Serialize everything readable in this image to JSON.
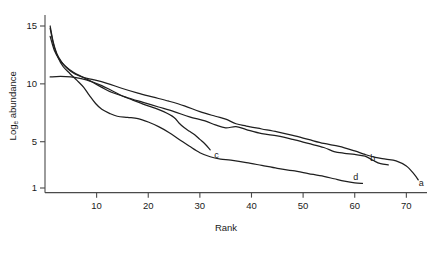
{
  "chart_data": {
    "type": "line",
    "title": "",
    "xlabel": "Rank",
    "ylabel": "Log_e abundance",
    "ylabel_base": "Log",
    "ylabel_sub": "e",
    "ylabel_rest": " abundance",
    "xlim": [
      0,
      74
    ],
    "ylim": [
      0.6,
      15.6
    ],
    "xticks": [
      10,
      20,
      30,
      40,
      50,
      60,
      70
    ],
    "xtick_labels": [
      "10",
      "20",
      "30",
      "40",
      "50",
      "60",
      "70"
    ],
    "yticks": [
      1,
      5,
      10,
      15
    ],
    "ytick_labels": [
      "1",
      "5",
      "10",
      "15"
    ],
    "grid": false,
    "legend": "inline-end-labels",
    "series": [
      {
        "name": "a",
        "label": "a",
        "label_x": 72.9,
        "label_y": 1.45,
        "points": [
          [
            1,
            15.0
          ],
          [
            1.6,
            13.6
          ],
          [
            2.3,
            12.6
          ],
          [
            3.2,
            11.9
          ],
          [
            4.4,
            11.3
          ],
          [
            5.8,
            10.85
          ],
          [
            7.5,
            10.55
          ],
          [
            9.5,
            10.35
          ],
          [
            12,
            10.05
          ],
          [
            15,
            9.6
          ],
          [
            18,
            9.2
          ],
          [
            21,
            8.85
          ],
          [
            24,
            8.5
          ],
          [
            27,
            8.1
          ],
          [
            30,
            7.6
          ],
          [
            33,
            7.2
          ],
          [
            35,
            6.95
          ],
          [
            37,
            6.55
          ],
          [
            39,
            6.35
          ],
          [
            42,
            6.1
          ],
          [
            45,
            5.85
          ],
          [
            48,
            5.55
          ],
          [
            51,
            5.2
          ],
          [
            54,
            4.85
          ],
          [
            57,
            4.6
          ],
          [
            60,
            4.2
          ],
          [
            62,
            3.9
          ],
          [
            64,
            3.65
          ],
          [
            66,
            3.5
          ],
          [
            68,
            3.35
          ],
          [
            70,
            2.9
          ],
          [
            71.5,
            2.2
          ],
          [
            72.3,
            1.7
          ]
        ]
      },
      {
        "name": "b",
        "label": "b",
        "label_x": 63.5,
        "label_y": 3.6,
        "points": [
          [
            1,
            14.1
          ],
          [
            1.8,
            12.9
          ],
          [
            2.8,
            12.1
          ],
          [
            4.0,
            11.5
          ],
          [
            5.5,
            11.0
          ],
          [
            7.2,
            10.6
          ],
          [
            9,
            10.2
          ],
          [
            11,
            9.7
          ],
          [
            13,
            9.25
          ],
          [
            16,
            8.8
          ],
          [
            19,
            8.4
          ],
          [
            22,
            8.0
          ],
          [
            25,
            7.6
          ],
          [
            28,
            7.15
          ],
          [
            31,
            6.8
          ],
          [
            33,
            6.45
          ],
          [
            35,
            6.2
          ],
          [
            37,
            6.3
          ],
          [
            39,
            6.05
          ],
          [
            42,
            5.7
          ],
          [
            45,
            5.5
          ],
          [
            48,
            5.2
          ],
          [
            51,
            4.85
          ],
          [
            54,
            4.5
          ],
          [
            56,
            4.15
          ],
          [
            58,
            4.0
          ],
          [
            60,
            3.9
          ],
          [
            62,
            3.75
          ],
          [
            63.5,
            3.4
          ],
          [
            65,
            3.1
          ],
          [
            66.5,
            3.0
          ]
        ]
      },
      {
        "name": "c",
        "label": "c",
        "label_x": 33.2,
        "label_y": 3.85,
        "points": [
          [
            1,
            10.6
          ],
          [
            3,
            10.65
          ],
          [
            5,
            10.6
          ],
          [
            7,
            10.45
          ],
          [
            9,
            10.2
          ],
          [
            11,
            9.85
          ],
          [
            13,
            9.4
          ],
          [
            15,
            8.95
          ],
          [
            17,
            8.6
          ],
          [
            19,
            8.25
          ],
          [
            21,
            7.95
          ],
          [
            23,
            7.6
          ],
          [
            25,
            7.1
          ],
          [
            26,
            6.6
          ],
          [
            27,
            6.2
          ],
          [
            28,
            5.9
          ],
          [
            29,
            5.6
          ],
          [
            30,
            5.2
          ],
          [
            31,
            4.8
          ],
          [
            32,
            4.3
          ]
        ]
      },
      {
        "name": "d",
        "label": "d",
        "label_x": 60.2,
        "label_y": 1.95,
        "points": [
          [
            1,
            14.8
          ],
          [
            1.7,
            13.3
          ],
          [
            2.5,
            12.3
          ],
          [
            3.5,
            11.5
          ],
          [
            4.8,
            10.9
          ],
          [
            6.2,
            10.3
          ],
          [
            7.5,
            9.7
          ],
          [
            8.6,
            9.0
          ],
          [
            9.8,
            8.3
          ],
          [
            11,
            7.8
          ],
          [
            12.5,
            7.45
          ],
          [
            14,
            7.2
          ],
          [
            16,
            7.1
          ],
          [
            18,
            7.0
          ],
          [
            20,
            6.7
          ],
          [
            22,
            6.3
          ],
          [
            24,
            5.8
          ],
          [
            26,
            5.2
          ],
          [
            28,
            4.6
          ],
          [
            30,
            4.05
          ],
          [
            32,
            3.7
          ],
          [
            34,
            3.5
          ],
          [
            36,
            3.4
          ],
          [
            39,
            3.2
          ],
          [
            42,
            2.95
          ],
          [
            45,
            2.7
          ],
          [
            48,
            2.5
          ],
          [
            51,
            2.25
          ],
          [
            54,
            2.0
          ],
          [
            56,
            1.8
          ],
          [
            58,
            1.6
          ],
          [
            60,
            1.45
          ],
          [
            61.5,
            1.4
          ]
        ]
      }
    ]
  }
}
